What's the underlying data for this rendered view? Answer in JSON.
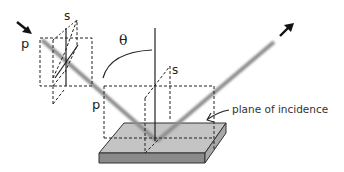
{
  "diagram": {
    "labels": {
      "incident_p": "p",
      "incident_s": "s",
      "angle": "θ",
      "reflect_p": "p",
      "reflect_s": "s",
      "plane": "plane of incidence"
    },
    "colors": {
      "beam": "#9a9a9a",
      "line": "#222222",
      "slab_top": "#c4c4c4",
      "slab_front": "#8a8a8a",
      "slab_side": "#a8a8a8"
    }
  }
}
